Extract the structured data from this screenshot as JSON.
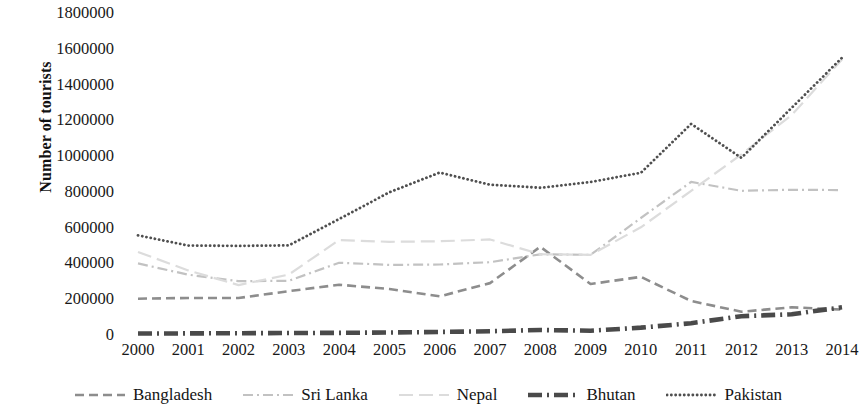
{
  "chart_data": {
    "type": "line",
    "title": "",
    "xlabel": "",
    "ylabel": "Number of tourists",
    "categories": [
      "2000",
      "2001",
      "2002",
      "2003",
      "2004",
      "2005",
      "2006",
      "2007",
      "2008",
      "2009",
      "2010",
      "2011",
      "2012",
      "2013",
      "2014"
    ],
    "x": [
      2000,
      2001,
      2002,
      2003,
      2004,
      2005,
      2006,
      2007,
      2008,
      2009,
      2010,
      2011,
      2012,
      2013,
      2014
    ],
    "ylim": [
      0,
      1800000
    ],
    "ytick_step": 200000,
    "yticks": [
      "1800000",
      "1600000",
      "1400000",
      "1200000",
      "1000000",
      "800000",
      "600000",
      "400000",
      "200000",
      "0"
    ],
    "grid": false,
    "legend_position": "bottom",
    "series": [
      {
        "name": "Bangladesh",
        "color": "#8d8d8d",
        "dash": "dashed",
        "width": 2.6,
        "values": [
          203000,
          207000,
          207000,
          245000,
          281000,
          257000,
          216000,
          290000,
          493000,
          285000,
          325000,
          190000,
          130000,
          155000,
          142000
        ]
      },
      {
        "name": "Sri Lanka",
        "color": "#c2c2c2",
        "dash": "dash-dot",
        "width": 2.2,
        "values": [
          400000,
          337000,
          301000,
          303000,
          404000,
          392000,
          394000,
          407000,
          451000,
          448000,
          654000,
          856000,
          806000,
          812000,
          810000
        ]
      },
      {
        "name": "Nepal",
        "color": "#dcdcdc",
        "dash": "long-dash",
        "width": 2.2,
        "values": [
          464000,
          361000,
          279000,
          338000,
          531000,
          521000,
          524000,
          534000,
          452000,
          448000,
          602000,
          806000,
          1010000,
          1230000,
          1540000
        ]
      },
      {
        "name": "Bhutan",
        "color": "#4a4a4a",
        "dash": "thick-dash-dot",
        "width": 4.6,
        "values": [
          8000,
          9000,
          10000,
          11000,
          12000,
          14000,
          17000,
          21000,
          28000,
          24000,
          41000,
          66000,
          105000,
          116000,
          155000
        ]
      },
      {
        "name": "Pakistan",
        "color": "#4f4f4f",
        "dash": "dotted",
        "width": 2.8,
        "values": [
          557000,
          500000,
          498000,
          501000,
          648000,
          798000,
          908000,
          840000,
          823000,
          855000,
          907000,
          1180000,
          990000,
          1270000,
          1550000
        ]
      }
    ]
  },
  "axes": {
    "y_title": "Number of tourists"
  },
  "legend": {
    "items": [
      {
        "label": "Bangladesh",
        "swatch": "dashed-line-swatch"
      },
      {
        "label": "Sri Lanka",
        "swatch": "dash-dot-line-swatch"
      },
      {
        "label": "Nepal",
        "swatch": "long-dash-line-swatch"
      },
      {
        "label": "Bhutan",
        "swatch": "thick-dash-dot-line-swatch"
      },
      {
        "label": "Pakistan",
        "swatch": "dotted-line-swatch"
      }
    ]
  }
}
